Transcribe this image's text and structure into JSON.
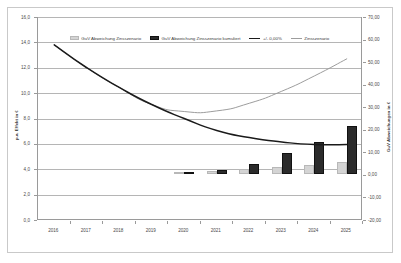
{
  "chart_data": {
    "type": "bar",
    "title": "",
    "subtitle": "",
    "categories": [
      "2016",
      "2017",
      "2018",
      "2019",
      "2020",
      "2021",
      "2022",
      "2023",
      "2024",
      "2025"
    ],
    "xlabel": "",
    "ylabel": "p.a. Effekt in €",
    "y2label": "GuV Abweichungen in €",
    "ylim": [
      0.0,
      16.0
    ],
    "y2lim": [
      -20.0,
      70.0
    ],
    "yticks": [
      "16,0",
      "14,0",
      "12,0",
      "10,0",
      "8,0",
      "6,0",
      "4,0",
      "2,0",
      "0,0"
    ],
    "ytick_values": [
      16.0,
      14.0,
      12.0,
      10.0,
      8.0,
      6.0,
      4.0,
      2.0,
      0.0
    ],
    "y2ticks": [
      "70,00",
      "60,00",
      "50,00",
      "40,00",
      "30,00",
      "20,00",
      "10,00",
      "0,00",
      "-10,00",
      "-20,00"
    ],
    "y2tick_values": [
      70.0,
      60.0,
      50.0,
      40.0,
      30.0,
      20.0,
      10.0,
      0.0,
      -10.0,
      -20.0
    ],
    "grid": true,
    "legend_position": "top-center",
    "series": [
      {
        "name": "GuV Abweichung Zinsszenario",
        "type": "bar",
        "axis": "right",
        "color": "#d4d4d4",
        "values": [
          0.0,
          0.0,
          0.0,
          0.0,
          0.2,
          1.2,
          2.1,
          3.0,
          3.9,
          5.1
        ]
      },
      {
        "name": "GuV Abweichung Zinsszenario kumuliert",
        "type": "bar",
        "axis": "right",
        "color": "#2b2b2b",
        "values": [
          0.0,
          0.0,
          0.0,
          0.0,
          0.2,
          1.8,
          4.5,
          9.1,
          14.3,
          21.4
        ]
      },
      {
        "name": "+/- 0,00%",
        "type": "line",
        "axis": "left",
        "color": "#1a1a1a",
        "values": [
          13.8,
          12.0,
          10.45,
          9.1,
          8.0,
          7.05,
          6.5,
          6.15,
          5.95,
          5.95
        ]
      },
      {
        "name": "Zinsszenario",
        "type": "line",
        "axis": "left",
        "color": "#9d9d9d",
        "values": [
          13.8,
          12.0,
          10.45,
          9.1,
          8.55,
          8.6,
          9.2,
          10.15,
          11.35,
          12.7
        ]
      }
    ]
  },
  "legend": {
    "items": [
      {
        "label": "GuV Abweichung Zinsszenario",
        "marker": "bar",
        "color": "#d4d4d4"
      },
      {
        "label": "GuV Abweichung Zinsszenario kumuliert",
        "marker": "bar",
        "color": "#2b2b2b"
      },
      {
        "label": "+/- 0,00%",
        "marker": "line",
        "color": "#1a1a1a"
      },
      {
        "label": "Zinsszenario",
        "marker": "line",
        "color": "#9d9d9d"
      }
    ]
  },
  "axes": {
    "left_title": "p.a. Effekt in €",
    "right_title": "GuV Abweichungen in €"
  }
}
